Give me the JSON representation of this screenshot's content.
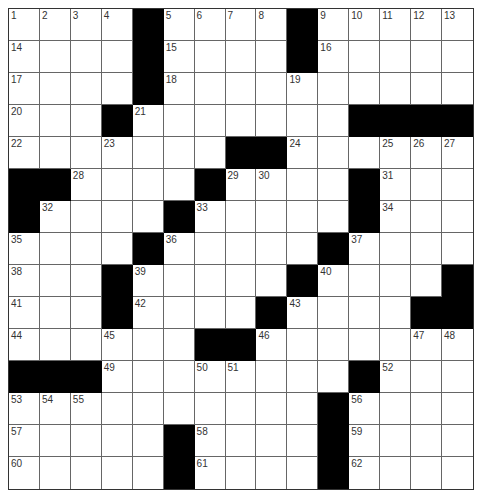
{
  "puzzle": {
    "rows": 15,
    "cols": 15,
    "colors": {
      "block": "#000000",
      "cell": "#ffffff",
      "line": "#666666",
      "number": "#333333"
    },
    "grid": [
      [
        "1",
        "2",
        "3",
        "4",
        "#",
        "5",
        "6",
        "7",
        "8",
        "#",
        "9",
        "10",
        "11",
        "12",
        "13"
      ],
      [
        "14",
        ".",
        ".",
        ".",
        "#",
        "15",
        ".",
        ".",
        ".",
        "#",
        "16",
        ".",
        ".",
        ".",
        "."
      ],
      [
        "17",
        ".",
        ".",
        ".",
        "#",
        "18",
        ".",
        ".",
        ".",
        "19",
        ".",
        ".",
        ".",
        ".",
        "."
      ],
      [
        "20",
        ".",
        ".",
        "#",
        "21",
        ".",
        ".",
        ".",
        ".",
        ".",
        ".",
        "#",
        "#",
        "#",
        "#"
      ],
      [
        "22",
        ".",
        ".",
        "23",
        ".",
        ".",
        ".",
        "#",
        "#",
        "24",
        ".",
        ".",
        "25",
        "26",
        "27"
      ],
      [
        "#",
        "#",
        "28",
        ".",
        ".",
        ".",
        "#",
        "29",
        "30",
        ".",
        ".",
        "#",
        "31",
        ".",
        "."
      ],
      [
        "#",
        "32",
        ".",
        ".",
        ".",
        "#",
        "33",
        ".",
        ".",
        ".",
        ".",
        "#",
        "34",
        ".",
        "."
      ],
      [
        "35",
        ".",
        ".",
        ".",
        "#",
        "36",
        ".",
        ".",
        ".",
        ".",
        "#",
        "37",
        ".",
        ".",
        "."
      ],
      [
        "38",
        ".",
        ".",
        "#",
        "39",
        ".",
        ".",
        ".",
        ".",
        "#",
        "40",
        ".",
        ".",
        ".",
        "#"
      ],
      [
        "41",
        ".",
        ".",
        "#",
        "42",
        ".",
        ".",
        ".",
        "#",
        "43",
        ".",
        ".",
        ".",
        "#",
        "#"
      ],
      [
        "44",
        ".",
        ".",
        "45",
        ".",
        ".",
        "#",
        "#",
        "46",
        ".",
        ".",
        ".",
        ".",
        "47",
        "48"
      ],
      [
        "#",
        "#",
        "#",
        "49",
        ".",
        ".",
        "50",
        "51",
        ".",
        ".",
        ".",
        "#",
        "52",
        ".",
        "."
      ],
      [
        "53",
        "54",
        "55",
        ".",
        ".",
        ".",
        ".",
        ".",
        ".",
        ".",
        "#",
        "56",
        ".",
        ".",
        "."
      ],
      [
        "57",
        ".",
        ".",
        ".",
        ".",
        "#",
        "58",
        ".",
        ".",
        ".",
        "#",
        "59",
        ".",
        ".",
        "."
      ],
      [
        "60",
        ".",
        ".",
        ".",
        ".",
        "#",
        "61",
        ".",
        ".",
        ".",
        "#",
        "62",
        ".",
        ".",
        "."
      ]
    ],
    "entries": {}
  }
}
